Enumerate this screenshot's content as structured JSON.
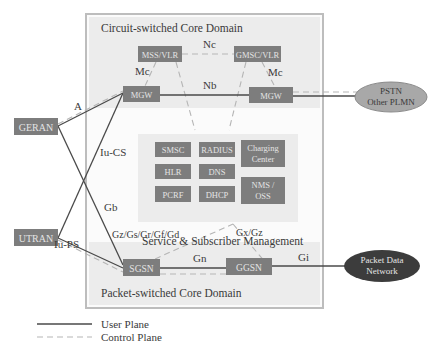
{
  "diagram": {
    "domains": {
      "circuit_switched": "Circuit-switched Core Domain",
      "service_mgmt": "Service & Subscriber Management",
      "packet_switched": "Packet-switched Core Domain"
    },
    "nodes": {
      "mss_vlr": "MSS/VLR",
      "gmsc_vlr": "GMSC/VLR",
      "mgw_left": "MGW",
      "mgw_right": "MGW",
      "geran": "GERAN",
      "utran": "UTRAN",
      "sgsn": "SGSN",
      "ggsn": "GGSN",
      "smsc": "SMSC",
      "radius": "RADIUS",
      "charging_line1": "Charging",
      "charging_line2": "Center",
      "hlr": "HLR",
      "dns": "DNS",
      "nms_line1": "NMS /",
      "nms_line2": "OSS",
      "pcrf": "PCRF",
      "dhcp": "DHCP"
    },
    "external": {
      "pstn_line1": "PSTN",
      "pstn_line2": "Other PLMN",
      "pdn_line1": "Packet Data",
      "pdn_line2": "Network"
    },
    "interfaces": {
      "nc": "Nc",
      "mc_left": "Mc",
      "mc_right": "Mc",
      "nb": "Nb",
      "a": "A",
      "iu_cs": "Iu-CS",
      "gb": "Gb",
      "iu_ps": "Iu-PS",
      "gz_gs": "Gz/Gs/Gr/Gf/Gd",
      "gx_gz": "Gx/Gz",
      "gn": "Gn",
      "gi": "Gi"
    },
    "legend": {
      "user_plane": "User Plane",
      "control_plane": "Control Plane"
    },
    "colors": {
      "node_fill": "#7d7d7d",
      "domain_fill": "#ececec",
      "frame": "#bdbdbd",
      "pdn_fill": "#3c3c3c",
      "pstn_fill": "#a8a8a8",
      "user_plane": "#4a4a4a",
      "control_plane": "#b5b5b5"
    }
  }
}
